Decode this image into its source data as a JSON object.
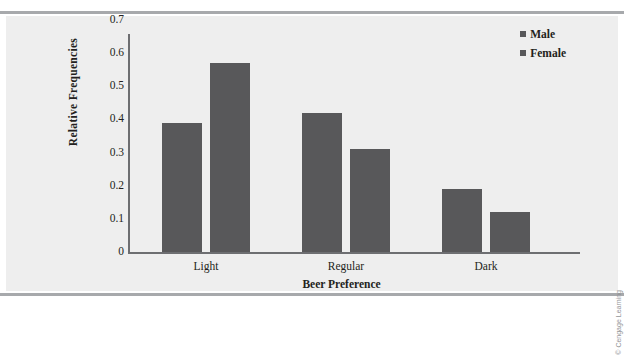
{
  "chart_data": {
    "type": "bar",
    "title": "",
    "xlabel": "Beer Preference",
    "ylabel": "Relative Frequencies",
    "categories": [
      "Light",
      "Regular",
      "Dark"
    ],
    "series": [
      {
        "name": "Male",
        "values": [
          0.39,
          0.42,
          0.19
        ]
      },
      {
        "name": "Female",
        "values": [
          0.57,
          0.31,
          0.12
        ]
      }
    ],
    "ylim": [
      0,
      0.7
    ],
    "ytick_values": [
      0,
      0.1,
      0.2,
      0.3,
      0.4,
      0.5,
      0.6,
      0.7
    ],
    "ytick_labels": [
      "0",
      "0.1",
      "0.2",
      "0.3",
      "0.4",
      "0.5",
      "0.6",
      "0.7"
    ],
    "grid": false,
    "legend_position": "top-right",
    "bar_color": "#58585a",
    "axis_color": "#6d6e71",
    "panel_background": "#eeeeee"
  },
  "legend": {
    "entries": [
      {
        "label": "Male"
      },
      {
        "label": "Female"
      }
    ]
  },
  "credit": "© Cengage Learning"
}
